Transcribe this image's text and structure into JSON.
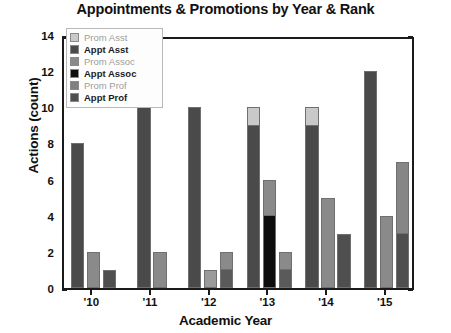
{
  "chart_data": {
    "type": "bar",
    "subtype": "grouped-stacked",
    "title": "Appointments & Promotions by Year & Rank",
    "xlabel": "Academic Year",
    "ylabel": "Actions (count)",
    "ylim": [
      0,
      14
    ],
    "ytick_step": 2,
    "yticks": [
      0,
      2,
      4,
      6,
      8,
      10,
      12,
      14
    ],
    "ytick_labels": [
      "0",
      "2",
      "4",
      "6",
      "8",
      "10",
      "12",
      "14"
    ],
    "grid": false,
    "legend_position": "upper-left-inside",
    "categories": [
      "'10",
      "'11",
      "'12",
      "'13",
      "'14",
      "'15"
    ],
    "series": [
      {
        "name": "Prom Asst",
        "color": "#c9c9c9",
        "values": [
          0,
          0,
          0,
          1,
          1,
          0
        ]
      },
      {
        "name": "Appt Asst",
        "color": "#4a4a4a",
        "values": [
          8,
          10,
          10,
          9,
          9,
          12
        ]
      },
      {
        "name": "Prom Assoc",
        "color": "#8a8a8a",
        "values": [
          2,
          2,
          1,
          2,
          5,
          4
        ]
      },
      {
        "name": "Appt Assoc",
        "color": "#0d0d0d",
        "values": [
          0,
          0,
          0,
          4,
          0,
          0
        ]
      },
      {
        "name": "Prom Prof",
        "color": "#808080",
        "values": [
          0,
          0,
          1,
          1,
          0,
          4
        ]
      },
      {
        "name": "Appt Prof",
        "color": "#4f4f4f",
        "values": [
          1,
          0,
          1,
          1,
          3,
          3
        ]
      }
    ],
    "bars": [
      {
        "category": "'10",
        "bars": [
          {
            "total": 8,
            "segments": [
              {
                "series": "Appt Asst",
                "value": 8,
                "color": "#4a4a4a"
              }
            ]
          },
          {
            "total": 2,
            "segments": [
              {
                "series": "Prom Assoc",
                "value": 2,
                "color": "#8a8a8a"
              }
            ]
          },
          {
            "total": 1,
            "segments": [
              {
                "series": "Appt Prof",
                "value": 1,
                "color": "#4f4f4f"
              }
            ]
          }
        ]
      },
      {
        "category": "'11",
        "bars": [
          {
            "total": 10,
            "segments": [
              {
                "series": "Appt Asst",
                "value": 10,
                "color": "#4a4a4a"
              }
            ]
          },
          {
            "total": 2,
            "segments": [
              {
                "series": "Prom Assoc",
                "value": 2,
                "color": "#8a8a8a"
              }
            ]
          }
        ]
      },
      {
        "category": "'12",
        "bars": [
          {
            "total": 10,
            "segments": [
              {
                "series": "Appt Asst",
                "value": 10,
                "color": "#4a4a4a"
              }
            ]
          },
          {
            "total": 1,
            "segments": [
              {
                "series": "Prom Assoc",
                "value": 1,
                "color": "#9a9a9a"
              }
            ]
          },
          {
            "total": 2,
            "segments": [
              {
                "series": "Appt Prof",
                "value": 1,
                "color": "#5a5a5a"
              },
              {
                "series": "Prom Prof",
                "value": 1,
                "color": "#8a8a8a"
              }
            ]
          }
        ]
      },
      {
        "category": "'13",
        "bars": [
          {
            "total": 10,
            "segments": [
              {
                "series": "Appt Asst",
                "value": 9,
                "color": "#4a4a4a"
              },
              {
                "series": "Prom Asst",
                "value": 1,
                "color": "#c9c9c9"
              }
            ]
          },
          {
            "total": 6,
            "segments": [
              {
                "series": "Appt Assoc",
                "value": 4,
                "color": "#0d0d0d"
              },
              {
                "series": "Prom Assoc",
                "value": 2,
                "color": "#8a8a8a"
              }
            ]
          },
          {
            "total": 2,
            "segments": [
              {
                "series": "Appt Prof",
                "value": 1,
                "color": "#5a5a5a"
              },
              {
                "series": "Prom Prof",
                "value": 1,
                "color": "#8a8a8a"
              }
            ]
          }
        ]
      },
      {
        "category": "'14",
        "bars": [
          {
            "total": 10,
            "segments": [
              {
                "series": "Appt Asst",
                "value": 9,
                "color": "#4a4a4a"
              },
              {
                "series": "Prom Asst",
                "value": 1,
                "color": "#c9c9c9"
              }
            ]
          },
          {
            "total": 5,
            "segments": [
              {
                "series": "Prom Assoc",
                "value": 5,
                "color": "#8a8a8a"
              }
            ]
          },
          {
            "total": 3,
            "segments": [
              {
                "series": "Appt Prof",
                "value": 3,
                "color": "#4f4f4f"
              }
            ]
          }
        ]
      },
      {
        "category": "'15",
        "bars": [
          {
            "total": 12,
            "segments": [
              {
                "series": "Appt Asst",
                "value": 12,
                "color": "#4a4a4a"
              }
            ]
          },
          {
            "total": 4,
            "segments": [
              {
                "series": "Prom Assoc",
                "value": 4,
                "color": "#8a8a8a"
              }
            ]
          },
          {
            "total": 7,
            "segments": [
              {
                "series": "Appt Prof",
                "value": 3,
                "color": "#4f4f4f"
              },
              {
                "series": "Prom Prof",
                "value": 4,
                "color": "#868686"
              }
            ]
          }
        ]
      }
    ]
  },
  "legend": {
    "items": [
      {
        "label": "Prom Asst",
        "color": "#c9c9c9",
        "style": "faint"
      },
      {
        "label": "Appt Asst",
        "color": "#4a4a4a",
        "style": "solid"
      },
      {
        "label": "Prom Assoc",
        "color": "#8a8a8a",
        "style": "faint"
      },
      {
        "label": "Appt Assoc",
        "color": "#0d0d0d",
        "style": "solid"
      },
      {
        "label": "Prom Prof",
        "color": "#808080",
        "style": "faint"
      },
      {
        "label": "Appt Prof",
        "color": "#4f4f4f",
        "style": "solid"
      }
    ]
  }
}
